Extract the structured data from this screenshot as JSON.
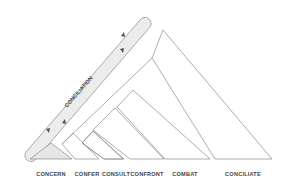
{
  "diagram": {
    "band_label": "CONCILIATION",
    "stages": [
      {
        "label": "CONCERN",
        "x": 51
      },
      {
        "label": "CONFER",
        "x": 87
      },
      {
        "label": "CONSULT",
        "x": 116
      },
      {
        "label": "CONFRONT",
        "x": 147
      },
      {
        "label": "COMBAT",
        "x": 185
      },
      {
        "label": "CONCILIATE",
        "x": 243
      }
    ],
    "colors": {
      "stroke": "#8a8a8a",
      "fill_light": "#ececec",
      "text": "#444444"
    }
  }
}
